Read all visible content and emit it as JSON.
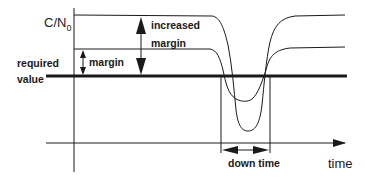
{
  "diagram": {
    "y_axis_label_main": "C/N",
    "y_axis_label_sub": "0",
    "x_axis_label": "time",
    "required_value_label_line1": "required",
    "required_value_label_line2": "value",
    "margin_label": "margin",
    "increased_margin_line1": "increased",
    "increased_margin_line2": "margin",
    "down_time_label": "down time",
    "colors": {
      "line": "#1a1a1a",
      "background": "#ffffff"
    }
  }
}
